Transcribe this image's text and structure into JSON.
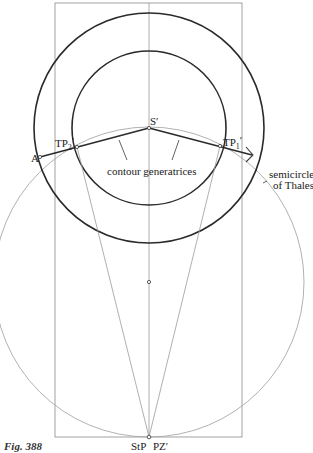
{
  "figure": {
    "caption": "Fig. 388",
    "labels": {
      "s_prime": "S′",
      "tp2_main": "TP",
      "tp2_sub": "2",
      "tp2_prime": "′",
      "tp1_main": "TP",
      "tp1_sub": "1",
      "tp1_prime": "′",
      "a_point": "A",
      "contour_generatrices": "contour generatrices",
      "semicircle_line1": "semicircle",
      "semicircle_line2": "of Thales",
      "stp": "StP",
      "pz_prime": "PZ′"
    },
    "colors": {
      "thick_stroke": "#2a2a2a",
      "thin_stroke": "#9a9a9a",
      "background": "#ffffff"
    }
  }
}
